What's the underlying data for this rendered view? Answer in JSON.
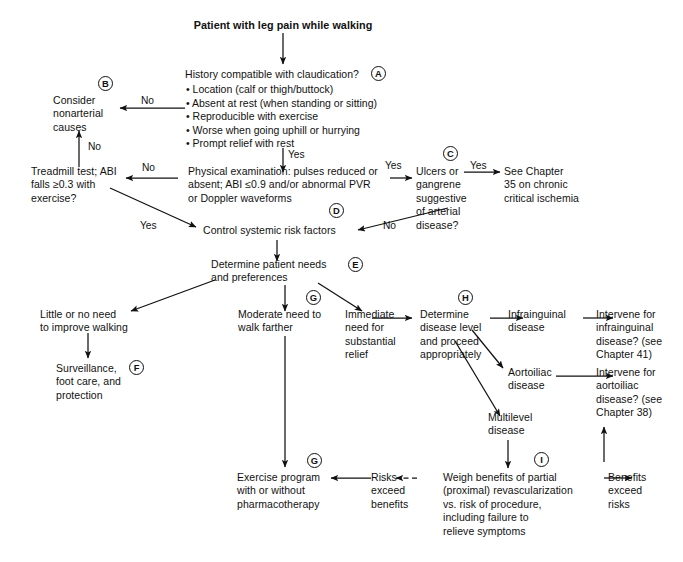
{
  "diagram": {
    "title": "Patient with leg pain while walking",
    "nodes": {
      "start": "Patient with leg pain while walking",
      "history_question": "History compatible with claudication?",
      "history_bullets": [
        "• Location (calf or thigh/buttock)",
        "• Absent at rest (when standing or sitting)",
        "• Reproducible with exercise",
        "• Worse when going uphill or hurrying",
        "• Prompt relief with rest"
      ],
      "nonarterial": "Consider\nnonarterial\ncauses",
      "treadmill": "Treadmill test; ABI\nfalls ≥0.3 with\nexercise?",
      "physical_exam": "Physical examination: pulses reduced or\nabsent; ABI ≤0.9 and/or abnormal PVR\nor Doppler waveforms",
      "ulcers": "Ulcers or\ngangrene\nsuggestive\nof arterial\ndisease?",
      "chapter35": "See Chapter\n35 on chronic\ncritical ischemia",
      "control_risk": "Control systemic risk factors",
      "determine_needs": "Determine patient needs\nand preferences",
      "little_need": "Little or no need\nto improve walking",
      "surveillance": "Surveillance,\nfoot care, and\nprotection",
      "moderate_need": "Moderate need to\nwalk farther",
      "immediate_need": "Immediate\nneed for\nsubstantial\nrelief",
      "determine_level": "Determine\ndisease level\nand proceed\nappropriately",
      "infrainguinal": "Infrainguinal\ndisease",
      "intervene_infrainguinal": "Intervene for\ninfrainguinal\ndisease? (see\nChapter 41)",
      "aortoiliac": "Aortoiliac\ndisease",
      "intervene_aortoiliac": "Intervene for\naortoiliac\ndisease? (see\nChapter 38)",
      "multilevel": "Multilevel\ndisease",
      "weigh_benefits": "Weigh benefits of partial\n(proximal) revascularization\nvs. risk of procedure,\nincluding failure to\nrelieve symptoms",
      "benefits_exceed": "Benefits\nexceed\nrisks",
      "risks_exceed": "Risks\nexceed\nbenefits",
      "exercise_program": "Exercise program\nwith or without\npharmacotherapy"
    },
    "edge_labels": {
      "history_no": "No",
      "history_yes": "Yes",
      "exam_no": "No",
      "exam_yes_right": "Yes",
      "treadmill_no": "No",
      "treadmill_yes": "Yes",
      "ulcers_yes": "Yes",
      "ulcers_no": "No"
    },
    "key_markers": {
      "a": "A",
      "b": "B",
      "c": "C",
      "d": "D",
      "e": "E",
      "f": "F",
      "g_upper": "G",
      "g_lower": "G",
      "h": "H",
      "i": "I"
    },
    "colors": {
      "ink": "#111111",
      "background": "#ffffff"
    }
  }
}
